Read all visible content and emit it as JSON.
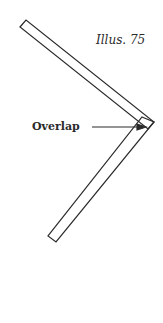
{
  "caption": "Illus. 75",
  "label": "Overlap",
  "colors": {
    "stroke": "#2a2a2a",
    "background": "#ffffff"
  }
}
